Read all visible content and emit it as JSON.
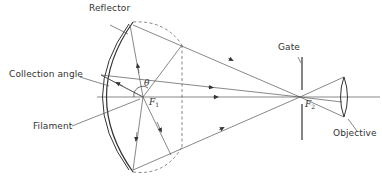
{
  "diagram": {
    "title": "",
    "labels": {
      "reflector": "Reflector",
      "collection_angle": "Collection angle",
      "filament": "Filament",
      "gate": "Gate",
      "objective": "Objective",
      "theta": "θ",
      "f1": "F",
      "f1_sub": "1",
      "f2": "F",
      "f2_sub": "2"
    },
    "nodes": [
      "Reflector",
      "Filament (F1)",
      "Collection angle (θ)",
      "Gate (F2)",
      "Objective"
    ],
    "edges": [
      {
        "from": "Filament (F1)",
        "to": "Reflector",
        "kind": "ray"
      },
      {
        "from": "Reflector",
        "to": "Gate (F2)",
        "kind": "reflected ray"
      },
      {
        "from": "Gate (F2)",
        "to": "Objective",
        "kind": "ray"
      }
    ],
    "colors": {
      "line": "#444444",
      "text": "#333333",
      "background": "#ffffff"
    }
  }
}
